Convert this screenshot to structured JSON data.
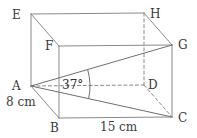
{
  "figure": {
    "kind": "cuboid-geometry-diagram",
    "background_color": "#ffffff",
    "stroke_color": "#8a8a8a",
    "dark_stroke_color": "#6e6e6e",
    "text_color": "#3a3a3a",
    "vertices": [
      {
        "id": "E",
        "label": "E",
        "x": 31,
        "y": 14,
        "label_x": 12,
        "label_y": 9,
        "hidden": false
      },
      {
        "id": "H",
        "label": "H",
        "x": 144,
        "y": 13,
        "label_x": 150,
        "label_y": 8,
        "hidden": false
      },
      {
        "id": "F",
        "label": "F",
        "x": 59,
        "y": 46,
        "label_x": 45,
        "label_y": 40,
        "hidden": false
      },
      {
        "id": "G",
        "label": "G",
        "x": 172,
        "y": 45,
        "label_x": 178,
        "label_y": 39,
        "hidden": false
      },
      {
        "id": "A",
        "label": "A",
        "x": 31,
        "y": 86,
        "label_x": 12,
        "label_y": 80,
        "hidden": false
      },
      {
        "id": "D",
        "label": "D",
        "x": 144,
        "y": 85,
        "label_x": 148,
        "label_y": 79,
        "hidden": false
      },
      {
        "id": "B",
        "label": "B",
        "x": 59,
        "y": 118,
        "label_x": 50,
        "label_y": 122,
        "hidden": false
      },
      {
        "id": "C",
        "label": "C",
        "x": 172,
        "y": 117,
        "label_x": 178,
        "label_y": 112,
        "hidden": false
      }
    ],
    "edges": [
      {
        "from": "E",
        "to": "H",
        "style": "solid",
        "name": "edge-EH"
      },
      {
        "from": "E",
        "to": "F",
        "style": "solid",
        "name": "edge-EF"
      },
      {
        "from": "E",
        "to": "A",
        "style": "solid",
        "name": "edge-EA"
      },
      {
        "from": "H",
        "to": "G",
        "style": "solid",
        "name": "edge-HG"
      },
      {
        "from": "F",
        "to": "G",
        "style": "solid",
        "name": "edge-FG"
      },
      {
        "from": "F",
        "to": "B",
        "style": "solid",
        "name": "edge-FB"
      },
      {
        "from": "G",
        "to": "C",
        "style": "solid",
        "name": "edge-GC"
      },
      {
        "from": "A",
        "to": "B",
        "style": "solid",
        "name": "edge-AB"
      },
      {
        "from": "B",
        "to": "C",
        "style": "solid",
        "name": "edge-BC"
      },
      {
        "from": "H",
        "to": "D",
        "style": "dashed",
        "name": "edge-HD"
      },
      {
        "from": "A",
        "to": "D",
        "style": "dashed",
        "name": "edge-AD"
      },
      {
        "from": "D",
        "to": "C",
        "style": "dashed",
        "name": "edge-DC"
      }
    ],
    "diagonals": [
      {
        "from": "A",
        "to": "G",
        "style": "solid",
        "name": "diagonal-AG"
      },
      {
        "from": "A",
        "to": "C",
        "style": "solid",
        "name": "diagonal-AC"
      }
    ],
    "angle": {
      "label": "37°",
      "value": 37,
      "unit": "degrees",
      "at_vertex": "A",
      "between": [
        "A-G",
        "A-C"
      ],
      "label_x": 62,
      "label_y": 79,
      "arc_radius": 59
    },
    "dimensions": [
      {
        "label": "8 cm",
        "name": "dimension-height-8cm",
        "edge": "A-B",
        "x": 6,
        "y": 96
      },
      {
        "label": "15 cm",
        "name": "dimension-length-15cm",
        "edge": "B-C",
        "x": 100,
        "y": 121
      }
    ]
  }
}
